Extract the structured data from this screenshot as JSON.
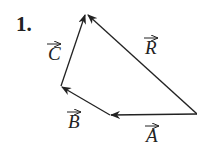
{
  "top_text_fragment": "...",
  "problem_number": "1.",
  "diagram": {
    "type": "vector polygon",
    "vectors": [
      {
        "name": "A",
        "label": "A",
        "from": [
          197,
          114
        ],
        "to": [
          110,
          115
        ]
      },
      {
        "name": "B",
        "label": "B",
        "from": [
          110,
          115
        ],
        "to": [
          61,
          86
        ]
      },
      {
        "name": "C",
        "label": "C",
        "from": [
          61,
          86
        ],
        "to": [
          86,
          14
        ]
      },
      {
        "name": "R",
        "label": "R",
        "from": [
          197,
          114
        ],
        "to": [
          86,
          14
        ]
      }
    ],
    "line_color": "#222222"
  }
}
